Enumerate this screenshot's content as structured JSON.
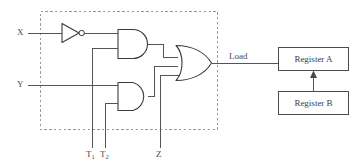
{
  "diagram": {
    "colors": {
      "wire": "#555555",
      "gate_outline": "#3c3c3c",
      "group_box": "#9a9a9a",
      "register_outline": "#4a4a4a",
      "background": "#ffffff"
    },
    "inputs": [
      {
        "id": "x",
        "label": "X"
      },
      {
        "id": "y",
        "label": "Y"
      },
      {
        "id": "t1",
        "label": "T",
        "sub": "1"
      },
      {
        "id": "t2",
        "label": "T",
        "sub": "2"
      },
      {
        "id": "z",
        "label": "Z"
      }
    ],
    "gates": [
      {
        "id": "inverter",
        "type": "NOT",
        "inputs": [
          "X"
        ],
        "output": "X'"
      },
      {
        "id": "and-upper",
        "type": "AND",
        "inputs": [
          "X'",
          "T1"
        ]
      },
      {
        "id": "and-lower",
        "type": "AND",
        "inputs": [
          "Y",
          "T2"
        ]
      },
      {
        "id": "or-gate",
        "type": "OR",
        "inputs": [
          "and-upper",
          "and-lower",
          "Z"
        ],
        "output": "Load"
      }
    ],
    "signals": [
      {
        "id": "load",
        "label": "Load"
      }
    ],
    "registers": [
      {
        "id": "register-a",
        "label": "Register A"
      },
      {
        "id": "register-b",
        "label": "Register B"
      }
    ],
    "connections": [
      {
        "from": "register-b",
        "to": "register-a",
        "arrow": "up"
      },
      {
        "from": "or-gate",
        "to": "register-a",
        "signal": "Load"
      }
    ]
  }
}
